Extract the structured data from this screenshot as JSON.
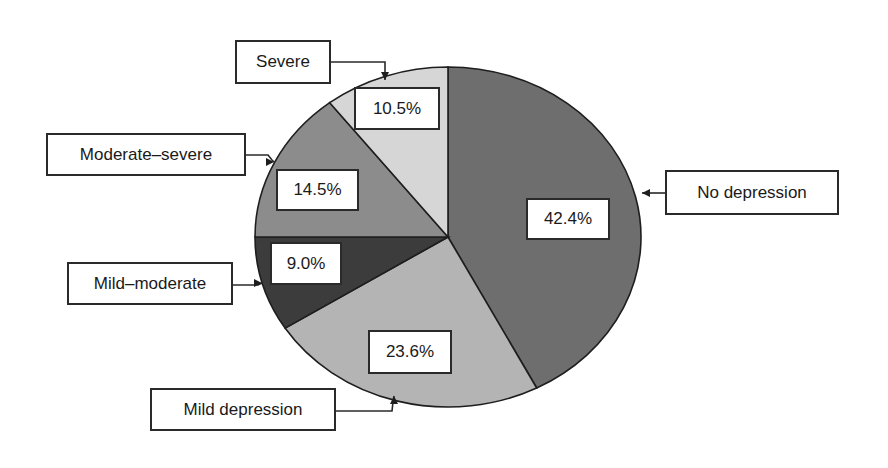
{
  "chart_data": {
    "type": "pie",
    "title": "",
    "start_angle_deg": -90,
    "direction": "clockwise",
    "slices": [
      {
        "label": "No depression",
        "value": 42.4,
        "value_label": "42.4%",
        "color": "#6e6e6e"
      },
      {
        "label": "Mild depression",
        "value": 23.6,
        "value_label": "23.6%",
        "color": "#b4b4b4"
      },
      {
        "label": "Mild–moderate",
        "value": 9.0,
        "value_label": "9.0%",
        "color": "#3c3c3c"
      },
      {
        "label": "Moderate–severe",
        "value": 14.5,
        "value_label": "14.5%",
        "color": "#8c8c8c"
      },
      {
        "label": "Severe",
        "value": 10.5,
        "value_label": "10.5%",
        "color": "#d6d6d6"
      }
    ],
    "legend": "callout boxes with arrows"
  }
}
